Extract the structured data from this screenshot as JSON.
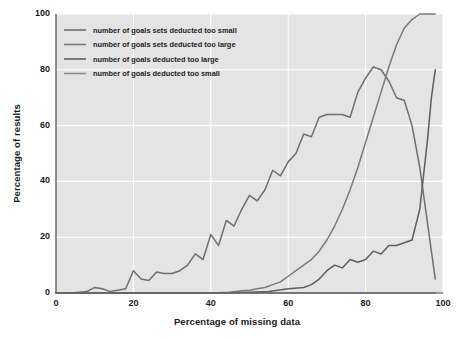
{
  "chart_data": {
    "type": "line",
    "title": "",
    "xlabel": "Percentage of missing data",
    "ylabel": "Percentage of results",
    "xlim": [
      0,
      100
    ],
    "ylim": [
      0,
      100
    ],
    "xticks": [
      0,
      20,
      40,
      60,
      80,
      100
    ],
    "yticks": [
      0,
      20,
      40,
      60,
      80,
      100
    ],
    "grid": true,
    "legend_position": "upper left",
    "background": "#e4e4e4",
    "gridline_color": "#ffffff",
    "line_color": "#6b6b6b",
    "series": [
      {
        "name": "number of goals sets deducted too small",
        "color": "#6e6e6e",
        "x": [
          0,
          2,
          4,
          6,
          8,
          10,
          12,
          14,
          16,
          18,
          20,
          22,
          24,
          26,
          28,
          30,
          32,
          34,
          36,
          38,
          40,
          42,
          44,
          46,
          48,
          50,
          52,
          54,
          56,
          58,
          60,
          62,
          64,
          66,
          68,
          70,
          72,
          74,
          76,
          78,
          80,
          82,
          84,
          86,
          88,
          90,
          92,
          94,
          96,
          98
        ],
        "values": [
          0,
          0,
          0,
          0.3,
          0.5,
          2,
          1.5,
          0.5,
          1,
          1.5,
          8,
          5,
          4.5,
          7.5,
          7,
          7,
          8,
          10,
          14,
          12,
          21,
          17,
          26,
          24,
          30,
          35,
          33,
          37,
          44,
          42,
          47,
          50,
          57,
          56,
          63,
          64,
          64,
          64,
          63,
          72,
          77,
          81,
          80,
          76,
          70,
          69,
          60,
          45,
          25,
          5
        ]
      },
      {
        "name": "number of goals sets deducted too large",
        "color": "#7a7a7a",
        "x": [
          0,
          5,
          10,
          15,
          20,
          25,
          30,
          35,
          40,
          45,
          48,
          50,
          52,
          54,
          56,
          58,
          60,
          62,
          64,
          66,
          68,
          70,
          72,
          74,
          76,
          78,
          80,
          82,
          84,
          86,
          88,
          90,
          92,
          94,
          96,
          98
        ],
        "values": [
          0,
          0,
          0,
          0,
          0,
          0,
          0,
          0,
          0,
          0.3,
          0.8,
          1,
          1.5,
          2,
          3,
          4,
          6,
          8,
          10,
          12,
          15,
          19,
          24,
          30,
          37,
          45,
          54,
          63,
          72,
          81,
          89,
          95,
          98,
          100,
          100,
          100
        ]
      },
      {
        "name": "number of goals deducted too large",
        "color": "#5e5e5e",
        "x": [
          0,
          10,
          20,
          30,
          40,
          50,
          55,
          60,
          64,
          66,
          68,
          70,
          72,
          74,
          76,
          78,
          80,
          82,
          84,
          86,
          88,
          90,
          92,
          94,
          96,
          97,
          98
        ],
        "values": [
          0,
          0,
          0,
          0,
          0,
          0.3,
          0.5,
          1.5,
          2,
          3,
          5,
          8,
          10,
          9,
          12,
          11,
          12,
          15,
          14,
          17,
          17,
          18,
          19,
          30,
          55,
          70,
          80
        ]
      },
      {
        "name": "number of goals deducted too small",
        "color": "#8c8c8c",
        "x": [
          0,
          20,
          40,
          60,
          80,
          98
        ],
        "values": [
          0,
          0,
          0,
          0,
          0,
          0
        ]
      }
    ]
  },
  "legend": {
    "entries": [
      {
        "label": "number of goals sets deducted too small"
      },
      {
        "label": "number of goals sets deducted too large"
      },
      {
        "label": "number of goals deducted too large"
      },
      {
        "label": "number of goals deducted too small"
      }
    ]
  },
  "axes": {
    "x_tick_labels": [
      "0",
      "20",
      "40",
      "60",
      "80",
      "100"
    ],
    "y_tick_labels": [
      "0",
      "20",
      "40",
      "60",
      "80",
      "100"
    ]
  }
}
